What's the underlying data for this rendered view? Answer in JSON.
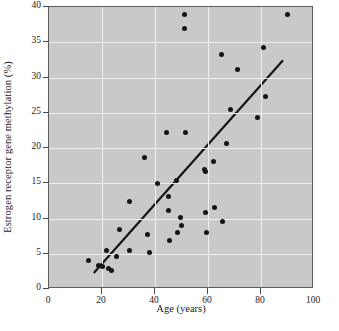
{
  "chart_data": {
    "type": "scatter",
    "title": "",
    "xlabel": "Age (years)",
    "ylabel": "Estrogen receptor gene methylation (%)",
    "xlim": [
      0,
      100
    ],
    "ylim": [
      0,
      40
    ],
    "xticks": [
      0,
      20,
      40,
      60,
      80,
      100
    ],
    "yticks": [
      0,
      5,
      10,
      15,
      20,
      25,
      30,
      35,
      40
    ],
    "grid": true,
    "legend": "none",
    "plot_background_color": "#c9c9c9",
    "gridline_color": "#eeeeee",
    "point_color": "#141414",
    "line_color": "#141414",
    "points": [
      [
        15.0,
        4.1
      ],
      [
        18.5,
        3.3
      ],
      [
        20.0,
        3.2
      ],
      [
        21.5,
        5.5
      ],
      [
        22.5,
        2.9
      ],
      [
        23.5,
        2.7
      ],
      [
        25.5,
        4.6
      ],
      [
        26.5,
        8.5
      ],
      [
        30.5,
        12.4
      ],
      [
        30.5,
        5.5
      ],
      [
        36.0,
        18.7
      ],
      [
        37.0,
        7.7
      ],
      [
        38.0,
        5.2
      ],
      [
        41.0,
        15.0
      ],
      [
        44.5,
        22.2
      ],
      [
        45.0,
        13.1
      ],
      [
        45.0,
        11.2
      ],
      [
        45.5,
        6.9
      ],
      [
        48.0,
        15.4
      ],
      [
        48.5,
        8.0
      ],
      [
        49.5,
        10.2
      ],
      [
        50.0,
        9.0
      ],
      [
        51.0,
        39.0
      ],
      [
        51.0,
        37.0
      ],
      [
        51.5,
        22.2
      ],
      [
        58.5,
        16.9
      ],
      [
        59.0,
        16.7
      ],
      [
        59.0,
        10.9
      ],
      [
        59.5,
        8.0
      ],
      [
        62.0,
        18.1
      ],
      [
        62.5,
        11.6
      ],
      [
        65.0,
        33.3
      ],
      [
        65.5,
        9.6
      ],
      [
        67.0,
        20.6
      ],
      [
        68.5,
        25.4
      ],
      [
        71.0,
        31.1
      ],
      [
        78.5,
        24.3
      ],
      [
        81.0,
        34.3
      ],
      [
        81.5,
        27.3
      ],
      [
        90.0,
        39.0
      ]
    ],
    "trendline": {
      "name": "linear fit",
      "x_start": 17.0,
      "y_start": 2.0,
      "x_end": 89.0,
      "y_end": 32.4
    }
  }
}
